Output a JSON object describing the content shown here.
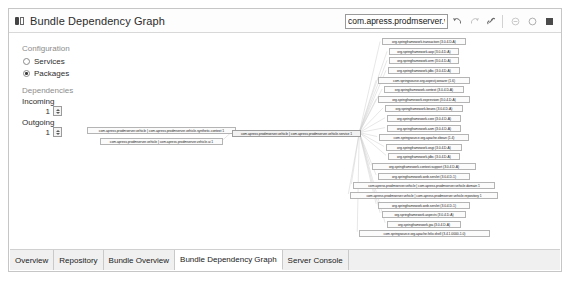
{
  "window": {
    "title": "Bundle Dependency Graph",
    "title_icon": "bundle-graph-icon"
  },
  "toolbar": {
    "filter_value": "com.apress.prodmserver.vehicl",
    "filter_placeholder": "type filter text",
    "buttons": [
      {
        "name": "back-button",
        "icon": "arrow-back-icon",
        "label": "Back"
      },
      {
        "name": "forward-button",
        "icon": "arrow-forward-icon",
        "label": "Forward"
      },
      {
        "name": "link-button",
        "icon": "link-icon",
        "label": "Link with Selection"
      },
      {
        "name": "zoom-out-button",
        "icon": "zoom-out-icon",
        "label": "Zoom Out"
      },
      {
        "name": "zoom-in-button",
        "icon": "zoom-in-icon",
        "label": "Zoom In"
      },
      {
        "name": "maximize-button",
        "icon": "maximize-icon",
        "label": "Maximize"
      }
    ]
  },
  "config_panel": {
    "configuration_label": "Configuration",
    "options": [
      {
        "label": "Services",
        "selected": false
      },
      {
        "label": "Packages",
        "selected": true
      }
    ],
    "dependencies_label": "Dependencies",
    "incoming_label": "Incoming",
    "incoming_value": "1",
    "outgoing_label": "Outgoing",
    "outgoing_value": "1"
  },
  "graph": {
    "left_nodes": [
      {
        "label": "com.apress.prodmserver.vehicle | com.apress.prodmserver.vehicle.synthetic.context 1",
        "x": 9,
        "y": 93,
        "w": 149
      },
      {
        "label": "com.apress.prodmserver.vehicle | com.apress.prodmserver.vehicle.ui 1",
        "x": 22,
        "y": 104,
        "w": 123
      }
    ],
    "hub_node": {
      "label": "com.apress.prodmserver.vehicle | com.apress.prodmserver.vehicle.service 1",
      "x": 154,
      "y": 96,
      "w": 129
    },
    "right_nodes": [
      {
        "label": "org.springframework.transaction (3.0.4.D-A)",
        "x": 304,
        "y": 4,
        "w": 84
      },
      {
        "label": "org.springframework.aop (3.0.4.D-A)",
        "x": 311,
        "y": 14,
        "w": 70
      },
      {
        "label": "org.springframework.orm (3.0.4.D-A)",
        "x": 311,
        "y": 23,
        "w": 70
      },
      {
        "label": "org.springframework.jdbc (3.0.4.D-A)",
        "x": 310,
        "y": 33,
        "w": 72
      },
      {
        "label": "com.springsource.org.aspectj.weaver (1.6)",
        "x": 300,
        "y": 43,
        "w": 92
      },
      {
        "label": "org.springframework.context (3.0.4.D-A)",
        "x": 306,
        "y": 52,
        "w": 80
      },
      {
        "label": "org.springframework.expression (3.0.4.D-A)",
        "x": 300,
        "y": 62,
        "w": 92
      },
      {
        "label": "org.springframework.beans (3.0.4.D-A)",
        "x": 307,
        "y": 71,
        "w": 78
      },
      {
        "label": "org.springframework.core (3.0.4.D-A)",
        "x": 309,
        "y": 81,
        "w": 74
      },
      {
        "label": "org.springframework.asm (3.0.4.D-A)",
        "x": 309,
        "y": 91,
        "w": 74
      },
      {
        "label": "com.springsource.org.apache.xbean (1.4)",
        "x": 301,
        "y": 100,
        "w": 90
      },
      {
        "label": "org.springframework.osgi (3.0.4.D-A)",
        "x": 308,
        "y": 110,
        "w": 76
      },
      {
        "label": "org.springframework.jdbc (3.0.4.D-A)",
        "x": 310,
        "y": 119,
        "w": 72
      },
      {
        "label": "org.springframework.context.support (3.0.4.D-A)",
        "x": 294,
        "y": 129,
        "w": 104
      },
      {
        "label": "org.springframework.web.servlet (3.0.4.D-1)",
        "x": 300,
        "y": 139,
        "w": 92
      },
      {
        "label": "com.apress.prodmserver.vehicle | com.apress.prodmserver.vehicle.domain 1",
        "x": 275,
        "y": 148,
        "w": 142
      },
      {
        "label": "com.apress.prodmserver.vehicle | com.apress.prodmserver.vehicle.repository 1",
        "x": 272,
        "y": 158,
        "w": 148
      },
      {
        "label": "org.springframework.web.servlet (3.0.4.D-1)",
        "x": 300,
        "y": 168,
        "w": 92
      },
      {
        "label": "org.springframework.aspects (3.0.4.D-A)",
        "x": 304,
        "y": 177,
        "w": 84
      },
      {
        "label": "org.springframework.jpa (3.0.4.D-A)",
        "x": 309,
        "y": 187,
        "w": 74
      },
      {
        "label": "com.springsource.org.apache.felix.shell (3.4.1.0000-1.0)",
        "x": 281,
        "y": 196,
        "w": 131
      }
    ]
  },
  "tabs": [
    {
      "label": "Overview",
      "active": false
    },
    {
      "label": "Repository",
      "active": false
    },
    {
      "label": "Bundle Overview",
      "active": false
    },
    {
      "label": "Bundle Dependency Graph",
      "active": true
    },
    {
      "label": "Server Console",
      "active": false
    }
  ]
}
